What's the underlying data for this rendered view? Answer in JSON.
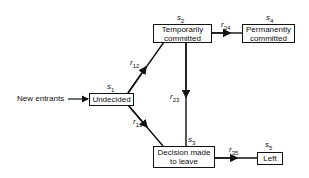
{
  "diagram": {
    "input": {
      "label": "New entrants"
    },
    "states": [
      {
        "id": "s1",
        "symbol": "s",
        "sub": "1",
        "label": "Undecided"
      },
      {
        "id": "s2",
        "symbol": "s",
        "sub": "2",
        "label": "Temporarily committed"
      },
      {
        "id": "s3",
        "symbol": "s",
        "sub": "3",
        "label": "Decision made to leave"
      },
      {
        "id": "s4",
        "symbol": "s",
        "sub": "4",
        "label": "Permanently committed"
      },
      {
        "id": "s5",
        "symbol": "s",
        "sub": "5",
        "label": "Left"
      }
    ],
    "transitions": [
      {
        "id": "r12",
        "symbol": "r",
        "sub": "12",
        "from": "s1",
        "to": "s2"
      },
      {
        "id": "r13",
        "symbol": "r",
        "sub": "13",
        "from": "s1",
        "to": "s3"
      },
      {
        "id": "r23",
        "symbol": "r",
        "sub": "23",
        "from": "s2",
        "to": "s3"
      },
      {
        "id": "r24",
        "symbol": "r",
        "sub": "24",
        "from": "s2",
        "to": "s4"
      },
      {
        "id": "r35",
        "symbol": "r",
        "sub": "35",
        "from": "s3",
        "to": "s5"
      }
    ]
  }
}
